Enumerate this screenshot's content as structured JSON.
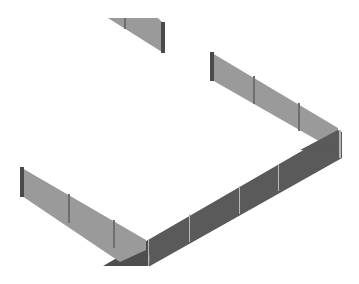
{
  "scene": {
    "type": "isometric-3d-render",
    "subject": "fence-panels",
    "background": "#ffffff",
    "colors": {
      "light_panel": "#9a9a9a",
      "dark_panel": "#5a5a5a",
      "post": "#6e6e6e",
      "post_highlight": "#b8b8b8"
    },
    "segments": [
      {
        "name": "top-fragment",
        "shade": "light",
        "posts": 2
      },
      {
        "name": "upper-right-fence",
        "shade": "light",
        "posts": 4
      },
      {
        "name": "lower-left-fence",
        "shade": "light",
        "posts": 4
      },
      {
        "name": "front-wall",
        "shade": "dark",
        "posts": 4
      }
    ]
  }
}
